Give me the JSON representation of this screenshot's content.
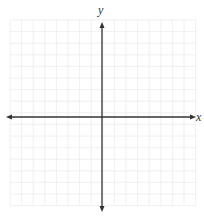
{
  "chart_data": {
    "type": "coordinate-grid",
    "title": "",
    "xlabel": "x",
    "ylabel": "y",
    "grid": true,
    "grid_columns": 16,
    "grid_rows": 16,
    "x_ticks_labeled": false,
    "y_ticks_labeled": false,
    "axes_arrows": true,
    "series": []
  },
  "labels": {
    "x": "x",
    "y": "y"
  },
  "colors": {
    "grid": "#ececec",
    "axis": "#333333",
    "background": "#ffffff"
  },
  "layout": {
    "grid_left": 10,
    "grid_top": 20,
    "cell": 11.6,
    "cols": 16,
    "rows": 16,
    "x_axis_y": 117,
    "y_axis_x": 102,
    "x_axis_start": 6,
    "x_axis_end": 196,
    "y_axis_start": 22,
    "y_axis_end": 212
  }
}
